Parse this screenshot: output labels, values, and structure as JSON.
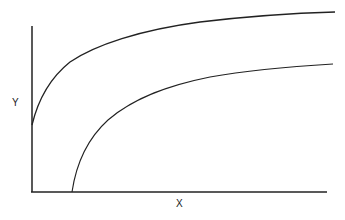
{
  "diagram": {
    "y_label": "Y",
    "x_label": "X",
    "curves": [
      {
        "name": "upper-curve",
        "description": "starts on Y axis at mid height, rises steeply then levels off"
      },
      {
        "name": "lower-curve",
        "description": "starts on X axis offset from origin, rises steeply then levels off below upper curve"
      }
    ],
    "colors": {
      "line": "#222222",
      "background": "#ffffff"
    }
  }
}
